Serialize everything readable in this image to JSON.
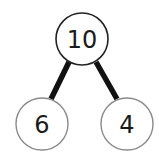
{
  "diagram": {
    "type": "part-whole number bond",
    "whole": {
      "value": "10"
    },
    "parts": [
      {
        "value": "6"
      },
      {
        "value": "4"
      }
    ],
    "colors": {
      "top_circle_stroke": "#222222",
      "part_circle_stroke": "#8a8a8a",
      "connector": "#111111",
      "text": "#1a1a1a"
    }
  }
}
